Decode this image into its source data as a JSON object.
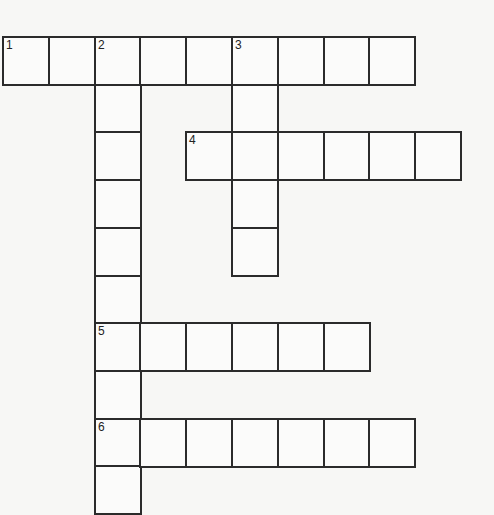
{
  "puzzle": {
    "type": "crossword",
    "grid": {
      "origin_x": 2,
      "origin_y": 36,
      "cell_w": 45.8,
      "cell_h": 47.7,
      "line_color": "#2b2b2b",
      "cell_color": "#fbfbfa",
      "background": "#f7f7f5"
    },
    "words": [
      {
        "number": "1",
        "direction": "across",
        "row": 0,
        "col": 0,
        "length": 9,
        "answer": ""
      },
      {
        "number": "2",
        "direction": "down",
        "row": 0,
        "col": 2,
        "length": 10,
        "answer": ""
      },
      {
        "number": "3",
        "direction": "down",
        "row": 0,
        "col": 5,
        "length": 5,
        "answer": ""
      },
      {
        "number": "4",
        "direction": "across",
        "row": 2,
        "col": 4,
        "length": 6,
        "answer": ""
      },
      {
        "number": "5",
        "direction": "across",
        "row": 6,
        "col": 2,
        "length": 6,
        "answer": ""
      },
      {
        "number": "6",
        "direction": "across",
        "row": 8,
        "col": 2,
        "length": 7,
        "answer": ""
      }
    ]
  }
}
